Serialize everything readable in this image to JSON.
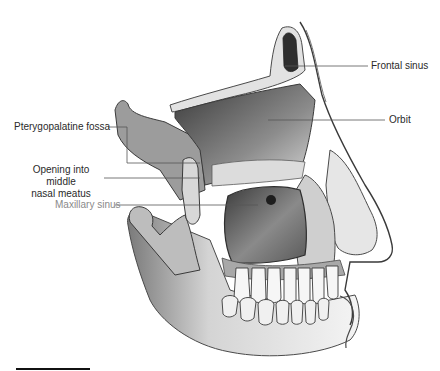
{
  "figure": {
    "style": "grayscale pencil illustration",
    "colors": {
      "background": "#ffffff",
      "label_text": "#2a2a2a",
      "label_text_muted": "#8a8a8a",
      "leader_line": "#555555",
      "bone_light": "#eeeeee",
      "bone_mid": "#c8c8c8",
      "cavity_dark": "#4a4a4a",
      "scale_bar": "#111111"
    }
  },
  "labels": {
    "frontal_sinus": "Frontal sinus",
    "orbit": "Orbit",
    "pterygopalatine_fossa": "Pterygopalatine fossa",
    "opening_line1": "Opening into middle",
    "opening_line2": "nasal meatus",
    "maxillary_sinus": "Maxillary sinus"
  },
  "scale_bar": {
    "x1": 16,
    "x2": 90,
    "y": 369
  }
}
